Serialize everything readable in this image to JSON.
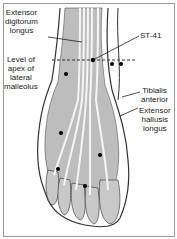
{
  "labels": {
    "edl": {
      "line1": "Extensor",
      "line2": "digitorum",
      "line3": "longus"
    },
    "level": {
      "line1": "Level of",
      "line2": "apex of",
      "line3": "lateral",
      "line4": "malleolus"
    },
    "st41": {
      "text": "ST-41"
    },
    "ta": {
      "line1": "Tibialis",
      "line2": "anterior"
    },
    "ehl": {
      "line1": "Extensor",
      "line2": "hallusis",
      "line3": "longus"
    }
  },
  "colors": {
    "bone_fill": "#bdbdbd",
    "outline": "#333333",
    "tendon": "#f2f2f2",
    "point": "#000000"
  }
}
